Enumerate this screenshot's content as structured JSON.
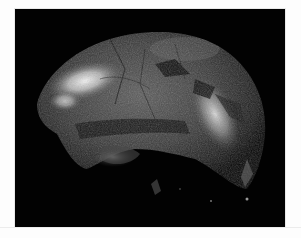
{
  "image": {
    "subject": "fossil skull (cranium) photographed on black background",
    "alt": "Fossil hominin cranium, side view, on black background",
    "colors": {
      "background": "#020202",
      "page": "#fdfdfd",
      "bone_dark": "#2a2a2a",
      "bone_mid": "#5a5a5a",
      "highlight": "#e8e8e8"
    }
  }
}
